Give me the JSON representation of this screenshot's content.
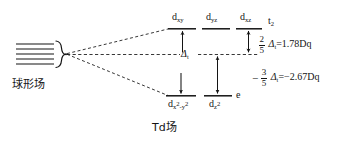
{
  "diagram": {
    "title_left_caption": "球形场",
    "title_bottom_caption": "Td场",
    "free_ion": {
      "name": "spherical-field-levels",
      "degenerate_line_count": 5
    },
    "levels": {
      "upper": {
        "term_label": "t",
        "term_sub": "2",
        "orbitals": [
          {
            "base": "d",
            "sub": "xy"
          },
          {
            "base": "d",
            "sub": "yz"
          },
          {
            "base": "d",
            "sub": "xz"
          }
        ]
      },
      "lower": {
        "term_label": "e",
        "orbitals": [
          {
            "base": "d",
            "sub_pre": "x",
            "sub_sup1": "2",
            "sub_mid": "-y",
            "sub_sup2": "2"
          },
          {
            "base": "d",
            "sub_pre": "z",
            "sub_sup1": "2"
          }
        ]
      },
      "barycenter": {
        "symbol": "Δ",
        "symbol_sub": "t"
      }
    },
    "energies": {
      "upper": {
        "sign": "",
        "frac_num": "2",
        "frac_den": "5",
        "delta": "Δ",
        "delta_sub": "t",
        "equals": "=",
        "value": "1.78Dq"
      },
      "lower": {
        "sign": "−",
        "frac_num": "3",
        "frac_den": "5",
        "delta": "Δ",
        "delta_sub": "t",
        "equals": "=",
        "value": "−2.67Dq"
      }
    },
    "colors": {
      "ink": "#141414",
      "background": "#ffffff"
    }
  }
}
